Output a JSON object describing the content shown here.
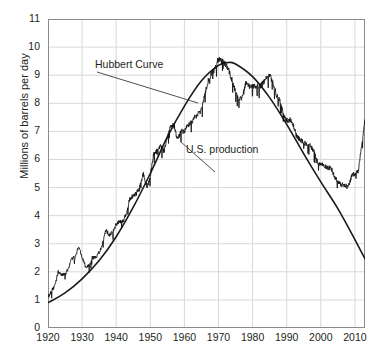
{
  "chart_data": {
    "type": "line",
    "title": "",
    "xlabel": "",
    "ylabel": "Millions of barrels per day",
    "xlim": [
      1920,
      2013
    ],
    "ylim": [
      0,
      11
    ],
    "xticks": [
      1920,
      1930,
      1940,
      1950,
      1960,
      1970,
      1980,
      1990,
      2000,
      2010
    ],
    "yticks": [
      0,
      1,
      2,
      3,
      4,
      5,
      6,
      7,
      8,
      9,
      10,
      11
    ],
    "grid": true,
    "legend_position": "none",
    "annotations": [
      {
        "name": "hubbert-curve-annotation",
        "text": "Hubbert Curve",
        "x": 1930,
        "y": 9.3
      },
      {
        "name": "us-production-annotation",
        "text": "U.S. production",
        "x": 1963,
        "y": 6.3
      }
    ],
    "series": [
      {
        "name": "Hubbert Curve",
        "color": "#1a1a1a",
        "x": [
          1920,
          1925,
          1930,
          1935,
          1940,
          1945,
          1950,
          1955,
          1960,
          1965,
          1970,
          1973,
          1975,
          1980,
          1985,
          1990,
          1995,
          2000,
          2005,
          2010,
          2013
        ],
        "values": [
          0.9,
          1.25,
          1.75,
          2.4,
          3.25,
          4.3,
          5.5,
          6.8,
          7.9,
          8.8,
          9.35,
          9.45,
          9.4,
          8.95,
          8.2,
          7.25,
          6.2,
          5.2,
          4.25,
          3.15,
          2.45
        ]
      },
      {
        "name": "U.S. production",
        "color": "#111111",
        "x": [
          1920,
          1921,
          1922,
          1923,
          1924,
          1925,
          1926,
          1927,
          1928,
          1929,
          1930,
          1931,
          1932,
          1933,
          1934,
          1935,
          1936,
          1937,
          1938,
          1939,
          1940,
          1941,
          1942,
          1943,
          1944,
          1945,
          1946,
          1947,
          1948,
          1949,
          1950,
          1951,
          1952,
          1953,
          1954,
          1955,
          1956,
          1957,
          1958,
          1959,
          1960,
          1961,
          1962,
          1963,
          1964,
          1965,
          1966,
          1967,
          1968,
          1969,
          1970,
          1971,
          1972,
          1973,
          1974,
          1975,
          1976,
          1977,
          1978,
          1979,
          1980,
          1981,
          1982,
          1983,
          1984,
          1985,
          1986,
          1987,
          1988,
          1989,
          1990,
          1991,
          1992,
          1993,
          1994,
          1995,
          1996,
          1997,
          1998,
          1999,
          2000,
          2001,
          2002,
          2003,
          2004,
          2005,
          2006,
          2007,
          2008,
          2009,
          2010,
          2011,
          2012,
          2013,
          2014
        ],
        "values": [
          1.1,
          1.3,
          1.5,
          2.0,
          1.9,
          1.9,
          2.1,
          2.5,
          2.5,
          2.9,
          2.5,
          2.2,
          2.2,
          2.5,
          2.5,
          2.7,
          3.0,
          3.5,
          3.3,
          3.4,
          3.7,
          3.8,
          3.8,
          4.1,
          4.6,
          4.7,
          4.8,
          5.1,
          5.5,
          5.0,
          5.4,
          6.2,
          6.3,
          6.5,
          6.3,
          6.8,
          7.2,
          7.2,
          6.7,
          7.0,
          7.0,
          7.2,
          7.3,
          7.5,
          7.6,
          7.8,
          8.3,
          8.8,
          9.1,
          9.2,
          9.6,
          9.5,
          9.4,
          9.2,
          8.8,
          8.4,
          8.1,
          8.2,
          8.7,
          8.6,
          8.6,
          8.6,
          8.6,
          8.7,
          8.9,
          9.0,
          8.7,
          8.3,
          8.1,
          7.6,
          7.4,
          7.4,
          7.2,
          6.8,
          6.7,
          6.6,
          6.5,
          6.5,
          6.3,
          5.9,
          5.8,
          5.8,
          5.7,
          5.7,
          5.4,
          5.2,
          5.1,
          5.1,
          5.0,
          5.4,
          5.5,
          5.6,
          6.5,
          7.5,
          8.7
        ]
      }
    ]
  },
  "axis": {
    "y_title": "Millions of barrels per day"
  }
}
